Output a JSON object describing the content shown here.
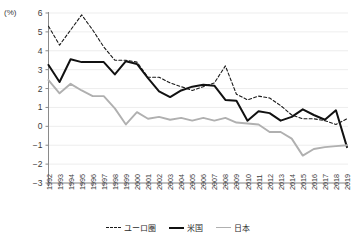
{
  "chart_data": {
    "type": "line",
    "title": "",
    "xlabel": "",
    "ylabel": "",
    "unit_label": "(%)",
    "grid": true,
    "legend_position": "bottom",
    "ylim": [
      -3,
      6
    ],
    "ytick_labels": [
      "6",
      "5",
      "4",
      "3",
      "2",
      "1",
      "0",
      "-1",
      "-2",
      "-3"
    ],
    "yticks": [
      6,
      5,
      4,
      3,
      2,
      1,
      0,
      -1,
      -2,
      -3
    ],
    "categories": [
      "1992",
      "1993",
      "1994",
      "1995",
      "1996",
      "1997",
      "1998",
      "1999",
      "2000",
      "2001",
      "2002",
      "2003",
      "2004",
      "2005",
      "2006",
      "2007",
      "2008",
      "2009",
      "2010",
      "2011",
      "2012",
      "2013",
      "2014",
      "2015",
      "2016",
      "2017",
      "2018",
      "2019"
    ],
    "x": [
      1992,
      1993,
      1994,
      1995,
      1996,
      1997,
      1998,
      1999,
      2000,
      2001,
      2002,
      2003,
      2004,
      2005,
      2006,
      2007,
      2008,
      2009,
      2010,
      2011,
      2012,
      2013,
      2014,
      2015,
      2016,
      2017,
      2018,
      2019
    ],
    "series": [
      {
        "name": "ユーロ圏",
        "style": "dashed",
        "color": "#1a1a1a",
        "values": [
          5.3,
          4.3,
          5.1,
          5.9,
          5.1,
          4.2,
          3.5,
          3.5,
          3.4,
          2.6,
          2.6,
          2.3,
          2.1,
          1.9,
          2.1,
          2.3,
          3.2,
          1.7,
          1.4,
          1.6,
          1.5,
          1.1,
          0.6,
          0.4,
          0.4,
          0.3,
          0.1,
          0.4
        ]
      },
      {
        "name": "米国",
        "style": "solid-bold",
        "color": "#111111",
        "values": [
          3.25,
          2.35,
          3.55,
          3.4,
          3.4,
          3.4,
          2.75,
          3.45,
          3.3,
          2.55,
          1.85,
          1.55,
          1.9,
          2.1,
          2.2,
          2.15,
          1.4,
          1.35,
          0.3,
          0.8,
          0.7,
          0.3,
          0.5,
          0.9,
          0.6,
          0.35,
          0.85,
          -1.1
        ]
      },
      {
        "name": "日本",
        "style": "solid-gray",
        "color": "#b0b0b0",
        "values": [
          2.45,
          1.75,
          2.25,
          1.9,
          1.6,
          1.6,
          0.95,
          0.1,
          0.75,
          0.4,
          0.5,
          0.35,
          0.45,
          0.3,
          0.45,
          0.3,
          0.45,
          0.2,
          0.15,
          0.1,
          -0.3,
          -0.3,
          -0.65,
          -1.55,
          -1.2,
          -1.1,
          -1.05,
          -1.0
        ]
      }
    ]
  },
  "legend": {
    "entries": [
      {
        "label": "ユーロ圏"
      },
      {
        "label": "米国"
      },
      {
        "label": "日本"
      }
    ]
  }
}
